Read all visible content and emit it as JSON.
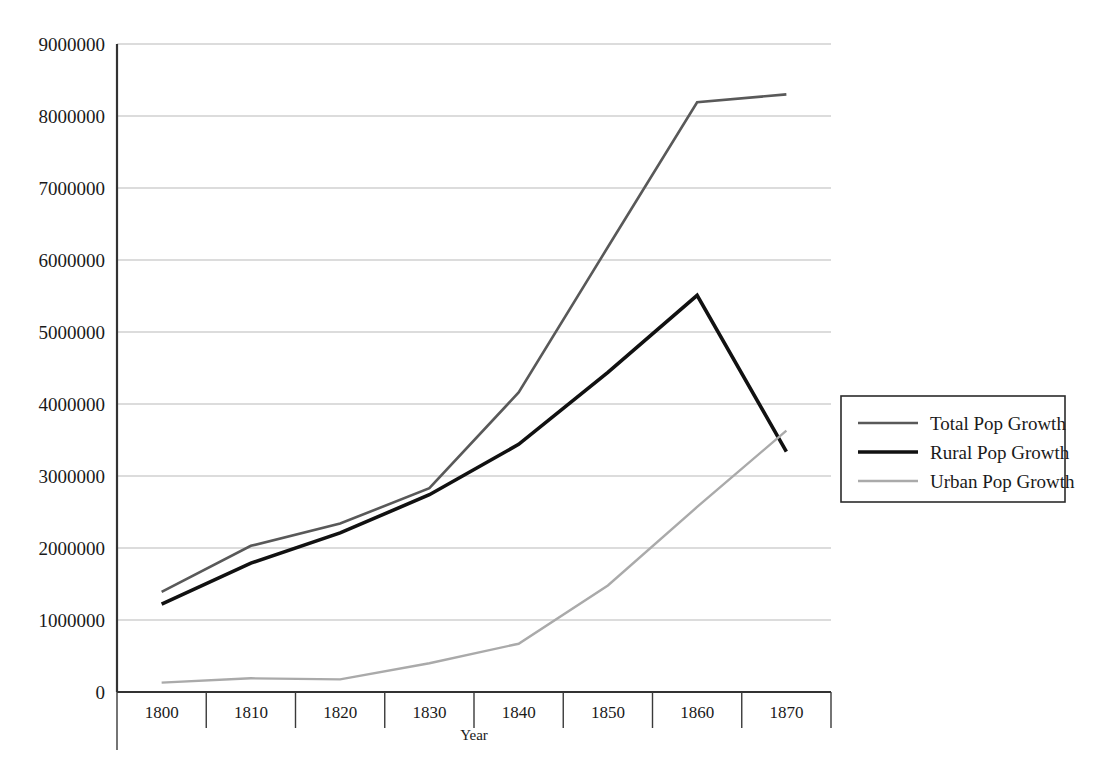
{
  "chart_data": {
    "type": "line",
    "title": "",
    "xlabel": "Year",
    "ylabel": "",
    "categories": [
      "1800",
      "1810",
      "1820",
      "1830",
      "1840",
      "1850",
      "1860",
      "1870"
    ],
    "x": [
      1800,
      1810,
      1820,
      1830,
      1840,
      1850,
      1860,
      1870
    ],
    "ylim": [
      0,
      9000000
    ],
    "xlim_categorical": true,
    "grid": "horizontal",
    "legend_position": "right",
    "ytick_labels": [
      "9000000",
      "8000000",
      "7000000",
      "6000000",
      "5000000",
      "4000000",
      "3000000",
      "2000000",
      "1000000",
      "0"
    ],
    "ytick_values": [
      9000000,
      8000000,
      7000000,
      6000000,
      5000000,
      4000000,
      3000000,
      2000000,
      1000000,
      0
    ],
    "series": [
      {
        "name": "Total Pop Growth",
        "color": "#595959",
        "width": 2.6,
        "values": [
          1390000,
          2030000,
          2340000,
          2830000,
          4160000,
          6180000,
          8190000,
          8300000
        ]
      },
      {
        "name": "Rural Pop Growth",
        "color": "#111111",
        "width": 3.6,
        "values": [
          1220000,
          1790000,
          2210000,
          2740000,
          3440000,
          4440000,
          5510000,
          3340000
        ]
      },
      {
        "name": "Urban Pop Growth",
        "color": "#aaaaaa",
        "width": 2.4,
        "values": [
          130000,
          190000,
          175000,
          400000,
          670000,
          1480000,
          2570000,
          3630000
        ]
      }
    ]
  },
  "legend": {
    "items": [
      {
        "label": "Total Pop Growth",
        "color": "#595959",
        "width": 2.6
      },
      {
        "label": "Rural Pop Growth",
        "color": "#111111",
        "width": 3.6
      },
      {
        "label": "Urban Pop Growth",
        "color": "#aaaaaa",
        "width": 2.4
      }
    ]
  },
  "axes": {
    "x_title": "Year",
    "y_title": ""
  }
}
